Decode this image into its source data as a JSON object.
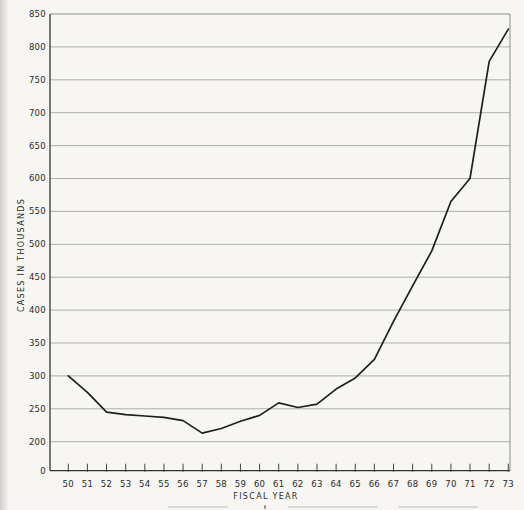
{
  "page": {
    "background": "#f7f6f3"
  },
  "chart_data": {
    "type": "line",
    "title": "",
    "xlabel": "FISCAL YEAR",
    "ylabel": "CASES IN THOUSANDS",
    "categories": [
      "50",
      "51",
      "52",
      "53",
      "54",
      "55",
      "56",
      "57",
      "58",
      "59",
      "60",
      "61",
      "62",
      "63",
      "64",
      "65",
      "66",
      "67",
      "68",
      "69",
      "70",
      "71",
      "72",
      "73"
    ],
    "values": [
      300,
      275,
      245,
      241,
      239,
      237,
      232,
      213,
      220,
      231,
      240,
      259,
      252,
      257,
      280,
      297,
      325,
      383,
      437,
      490,
      565,
      600,
      778,
      827
    ],
    "series_name": "cases in thousands",
    "y_axis": {
      "ticks": [
        0,
        200,
        250,
        300,
        350,
        400,
        450,
        500,
        550,
        600,
        650,
        700,
        750,
        800,
        850
      ],
      "break_between": [
        0,
        200
      ],
      "note": "scale compressed between 0 and 200"
    },
    "ylim": [
      0,
      850
    ],
    "grid": "horizontal",
    "legend": "none",
    "colors": {
      "line": "#1f1f1f",
      "grid": "#a6a6a0",
      "axis_dark": "#32322e",
      "axis_light": "#8d8d87",
      "text": "#2a2a28",
      "background": "#f7f6f3"
    }
  }
}
